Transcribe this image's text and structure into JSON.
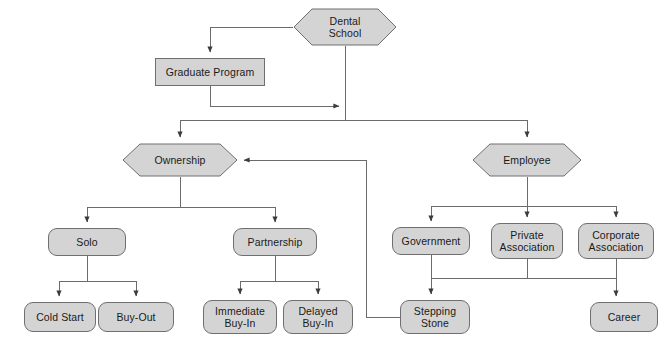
{
  "diagram": {
    "style": {
      "node_fill": "#d4d4d4",
      "node_stroke": "#6f6f6f",
      "edge_color": "#4a4a4a",
      "text_color": "#1a1a1a",
      "background": "#ffffff"
    },
    "nodes": [
      {
        "id": "dental-school",
        "label": "Dental\nSchool",
        "shape": "hexagon",
        "x": 293,
        "y": 8,
        "w": 104,
        "h": 38
      },
      {
        "id": "graduate-program",
        "label": "Graduate Program",
        "shape": "rect",
        "x": 155,
        "y": 58,
        "w": 110,
        "h": 28
      },
      {
        "id": "ownership",
        "label": "Ownership",
        "shape": "hexagon",
        "x": 122,
        "y": 143,
        "w": 116,
        "h": 34
      },
      {
        "id": "employee",
        "label": "Employee",
        "shape": "hexagon",
        "x": 472,
        "y": 143,
        "w": 110,
        "h": 34
      },
      {
        "id": "solo",
        "label": "Solo",
        "shape": "rounded",
        "x": 48,
        "y": 228,
        "w": 78,
        "h": 28
      },
      {
        "id": "partnership",
        "label": "Partnership",
        "shape": "rounded",
        "x": 233,
        "y": 228,
        "w": 84,
        "h": 28
      },
      {
        "id": "government",
        "label": "Government",
        "shape": "rounded",
        "x": 392,
        "y": 227,
        "w": 78,
        "h": 28
      },
      {
        "id": "private-association",
        "label": "Private\nAssociation",
        "shape": "rounded",
        "x": 491,
        "y": 223,
        "w": 72,
        "h": 36
      },
      {
        "id": "corporate-association",
        "label": "Corporate\nAssociation",
        "shape": "rounded",
        "x": 578,
        "y": 223,
        "w": 76,
        "h": 36
      },
      {
        "id": "cold-start",
        "label": "Cold Start",
        "shape": "rounded",
        "x": 24,
        "y": 302,
        "w": 72,
        "h": 30
      },
      {
        "id": "buy-out",
        "label": "Buy-Out",
        "shape": "rounded",
        "x": 98,
        "y": 302,
        "w": 76,
        "h": 30
      },
      {
        "id": "immediate-buy-in",
        "label": "Immediate\nBuy-In",
        "shape": "rounded",
        "x": 203,
        "y": 300,
        "w": 74,
        "h": 34
      },
      {
        "id": "delayed-buy-in",
        "label": "Delayed\nBuy-In",
        "shape": "rounded",
        "x": 283,
        "y": 300,
        "w": 70,
        "h": 34
      },
      {
        "id": "stepping-stone",
        "label": "Stepping\nStone",
        "shape": "rounded",
        "x": 400,
        "y": 300,
        "w": 70,
        "h": 34
      },
      {
        "id": "career",
        "label": "Career",
        "shape": "rounded",
        "x": 590,
        "y": 302,
        "w": 68,
        "h": 30
      }
    ],
    "edges": [
      {
        "from": "dental-school",
        "to": "graduate-program",
        "kind": "left-then-down"
      },
      {
        "from": "dental-school",
        "to": "ownership",
        "kind": "down-bus-left"
      },
      {
        "from": "dental-school",
        "to": "employee",
        "kind": "down-bus-right"
      },
      {
        "from": "graduate-program",
        "to": "dental-school-trunk",
        "kind": "down-then-right"
      },
      {
        "from": "ownership",
        "to": "solo",
        "kind": "down-split"
      },
      {
        "from": "ownership",
        "to": "partnership",
        "kind": "down-split"
      },
      {
        "from": "employee",
        "to": "government",
        "kind": "down-split"
      },
      {
        "from": "employee",
        "to": "private-association",
        "kind": "down-split"
      },
      {
        "from": "employee",
        "to": "corporate-association",
        "kind": "down-split"
      },
      {
        "from": "solo",
        "to": "cold-start",
        "kind": "down-split"
      },
      {
        "from": "solo",
        "to": "buy-out",
        "kind": "down-split"
      },
      {
        "from": "partnership",
        "to": "immediate-buy-in",
        "kind": "down-split"
      },
      {
        "from": "partnership",
        "to": "delayed-buy-in",
        "kind": "down-split"
      },
      {
        "from": "government",
        "to": "stepping-stone",
        "kind": "bus-down"
      },
      {
        "from": "private-association",
        "to": "bus",
        "kind": "bus-down"
      },
      {
        "from": "corporate-association",
        "to": "career",
        "kind": "bus-down"
      },
      {
        "from": "stepping-stone",
        "to": "ownership",
        "kind": "feedback-loop"
      }
    ]
  }
}
